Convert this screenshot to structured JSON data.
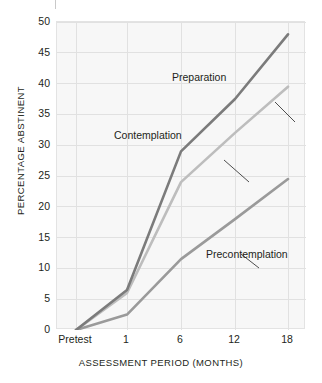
{
  "chart_data": {
    "type": "line",
    "title": "",
    "xlabel": "ASSESSMENT PERIOD (MONTHS)",
    "ylabel": "PERCENTAGE ABSTINENT",
    "categories": [
      "Pretest",
      "1",
      "6",
      "12",
      "18"
    ],
    "x": [
      0,
      1,
      6,
      12,
      18
    ],
    "xtick_labels": [
      "Pretest",
      "1",
      "6",
      "12",
      "18"
    ],
    "ytick_labels": [
      "0",
      "5",
      "10",
      "15",
      "20",
      "25",
      "30",
      "35",
      "40",
      "45",
      "50"
    ],
    "yticks": [
      0,
      5,
      10,
      15,
      20,
      25,
      30,
      35,
      40,
      45,
      50
    ],
    "ylim": [
      0,
      50
    ],
    "grid": true,
    "legend_position": "inline-annotations",
    "series": [
      {
        "name": "Preparation",
        "color": "#7b7b7b",
        "values": [
          0,
          6.5,
          29.0,
          37.5,
          48.0
        ]
      },
      {
        "name": "Contemplation",
        "color": "#bdbdbd",
        "values": [
          0,
          6.0,
          24.0,
          32.0,
          39.5
        ]
      },
      {
        "name": "Precontemplation",
        "color": "#9a9a9a",
        "values": [
          0,
          2.5,
          11.5,
          18.0,
          24.5
        ]
      }
    ],
    "annotations": [
      {
        "label": "Preparation",
        "text_x": 172,
        "text_y": 72,
        "leader": "M 218 80 L 238 100"
      },
      {
        "label": "Contemplation",
        "text_x": 114,
        "text_y": 130,
        "leader": "M 167 138 L 192 160"
      },
      {
        "label": "Precontemplation",
        "text_x": 206,
        "text_y": 249,
        "leader": "M 202 246 L 184 232"
      }
    ]
  },
  "axes": {
    "ylabel": "PERCENTAGE ABSTINENT",
    "xlabel": "ASSESSMENT PERIOD (MONTHS)"
  },
  "colors": {
    "plot_background": "#f7f7f7",
    "grid": "#e1e1e1",
    "frame": "#e3e3e3",
    "text": "#231f20",
    "preparation": "#7b7b7b",
    "contemplation": "#bdbdbd",
    "precontemplation": "#9a9a9a",
    "leader": "#3a3a3a"
  }
}
